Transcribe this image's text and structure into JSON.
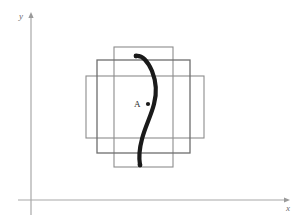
{
  "figure": {
    "title": "",
    "background_color": "#ffffff",
    "width": 300,
    "height": 223
  },
  "axes": {
    "color": "#a8a8a8",
    "origin": {
      "x": 31,
      "y": 200
    },
    "x_axis": {
      "label": "x",
      "label_x": 286,
      "label_y": 211,
      "start_x": 18,
      "end_x": 284,
      "y": 200
    },
    "y_axis": {
      "label": "y",
      "label_x": 19,
      "label_y": 19,
      "start_y": 215,
      "end_y": 16,
      "x": 31
    }
  },
  "rectangles": [
    {
      "name": "tall-vertical-rectangle",
      "stroke": "#8c8c8c",
      "stroke_width": 1.1,
      "x": 114,
      "y": 47,
      "width": 59,
      "height": 120
    },
    {
      "name": "wide-horizontal-rectangle",
      "stroke": "#8c8c8c",
      "stroke_width": 1.1,
      "x": 86,
      "y": 76,
      "width": 118,
      "height": 62
    },
    {
      "name": "medium-square-rectangle",
      "stroke": "#6e6e6e",
      "stroke_width": 1.3,
      "x": 97,
      "y": 60,
      "width": 93,
      "height": 93
    }
  ],
  "curve": {
    "name": "s-curve",
    "color": "#1a1a1a",
    "stroke_width": 4.2,
    "path": "M 136 56 C 143 55, 148 62, 152 71 C 156 81, 157 93, 154 104 C 151 116, 145 127, 142 139 C 139 150, 139 159, 140 165",
    "start": {
      "x": 136,
      "y": 56
    },
    "end": {
      "x": 140,
      "y": 165
    }
  },
  "point": {
    "name": "point-a",
    "label": "A",
    "label_x": 134,
    "label_y": 107,
    "dot_x": 148,
    "dot_y": 104,
    "dot_radius": 2.1,
    "color": "#1a1a1a"
  }
}
